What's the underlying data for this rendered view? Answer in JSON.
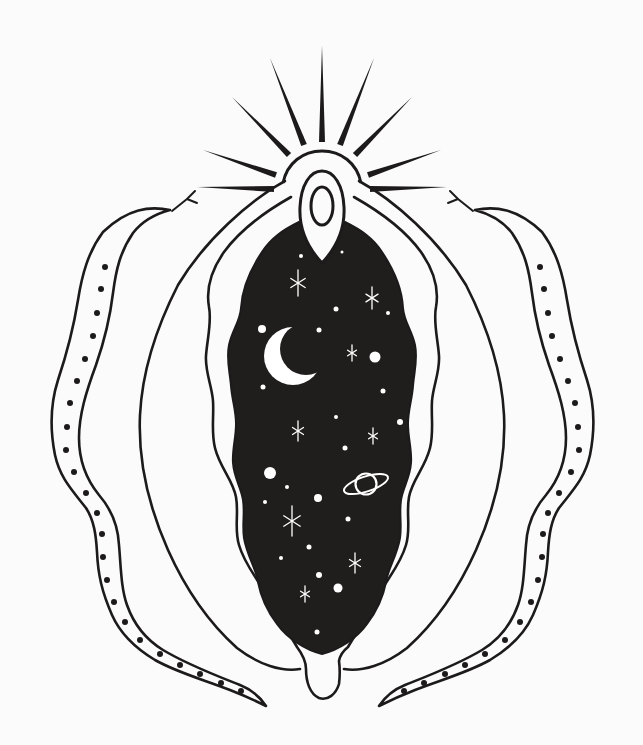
{
  "artwork": {
    "title": "Celestial vulva with serpents — black and white line illustration",
    "background_color": "#fbfbfb",
    "ink_color": "#1c1a1a",
    "night_fill_color": "#201d1d",
    "star_color": "#ffffff",
    "elements": [
      "sunburst-rays",
      "clitoral-hood-arch",
      "teardrop-hood",
      "inner-oval",
      "night-sky-center",
      "crescent-moon",
      "saturn-planet",
      "star-dots",
      "sparkle-stars",
      "outer-labia-contours",
      "inner-labia-contours",
      "perineum-u-tab",
      "left-snake",
      "right-snake",
      "snake-spots",
      "snake-tongues"
    ]
  },
  "sunburst": {
    "ray_half_width": 3,
    "rays": [
      {
        "base": [
          322,
          142
        ],
        "tip": [
          322,
          45
        ]
      },
      {
        "base": [
          304,
          145
        ],
        "tip": [
          270,
          58
        ]
      },
      {
        "base": [
          289,
          155
        ],
        "tip": [
          232,
          97
        ]
      },
      {
        "base": [
          276,
          175
        ],
        "tip": [
          203,
          150
        ]
      },
      {
        "base": [
          274,
          189
        ],
        "tip": [
          197,
          187
        ]
      },
      {
        "base": [
          340,
          145
        ],
        "tip": [
          374,
          58
        ]
      },
      {
        "base": [
          355,
          155
        ],
        "tip": [
          412,
          97
        ]
      },
      {
        "base": [
          368,
          175
        ],
        "tip": [
          441,
          150
        ]
      },
      {
        "base": [
          370,
          189
        ],
        "tip": [
          447,
          187
        ]
      }
    ]
  },
  "night_sky": {
    "dots": [
      [
        301,
        256,
        2
      ],
      [
        342,
        252,
        1.5
      ],
      [
        336,
        309,
        2.5
      ],
      [
        388,
        313,
        2
      ],
      [
        262,
        329,
        4
      ],
      [
        319,
        330,
        2.5
      ],
      [
        375,
        357,
        5.5
      ],
      [
        263,
        387,
        2.5
      ],
      [
        383,
        391,
        2.5
      ],
      [
        336,
        417,
        2
      ],
      [
        400,
        422,
        3
      ],
      [
        345,
        448,
        2.5
      ],
      [
        270,
        473,
        6
      ],
      [
        287,
        487,
        2
      ],
      [
        318,
        498,
        4
      ],
      [
        265,
        502,
        2
      ],
      [
        348,
        519,
        2.5
      ],
      [
        309,
        547,
        2.5
      ],
      [
        281,
        558,
        2
      ],
      [
        319,
        575,
        3
      ],
      [
        338,
        588,
        4.5
      ],
      [
        317,
        632,
        2.5
      ]
    ],
    "sparkles": [
      [
        298,
        283,
        13
      ],
      [
        372,
        298,
        11
      ],
      [
        352,
        353,
        8
      ],
      [
        298,
        431,
        10
      ],
      [
        373,
        436,
        8
      ],
      [
        292,
        521,
        15
      ],
      [
        355,
        563,
        10
      ],
      [
        305,
        594,
        8
      ]
    ],
    "moon": {
      "cx": 293,
      "cy": 356,
      "r": 29,
      "bite_cx": 306,
      "bite_cy": 349,
      "bite_r": 26
    },
    "saturn": {
      "cx": 366,
      "cy": 484,
      "body_r": 10.5,
      "ring_rx": 23,
      "ring_ry": 7.5,
      "ring_tilt": -18
    }
  },
  "snakes": {
    "mirror_x": 645,
    "dot_r": 3,
    "left_dots": [
      [
        105,
        267
      ],
      [
        101,
        289
      ],
      [
        97,
        313
      ],
      [
        93,
        336
      ],
      [
        85,
        359
      ],
      [
        77,
        381
      ],
      [
        70,
        403
      ],
      [
        67,
        427
      ],
      [
        66,
        450
      ],
      [
        74,
        472
      ],
      [
        86,
        493
      ],
      [
        97,
        513
      ],
      [
        102,
        534
      ],
      [
        103,
        557
      ],
      [
        107,
        580
      ],
      [
        114,
        602
      ],
      [
        125,
        622
      ],
      [
        140,
        640
      ],
      [
        160,
        654
      ],
      [
        180,
        665
      ],
      [
        200,
        674
      ],
      [
        221,
        683
      ],
      [
        241,
        691
      ]
    ]
  }
}
